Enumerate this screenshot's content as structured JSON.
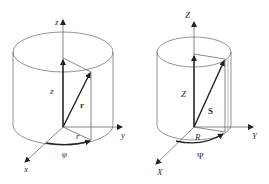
{
  "diagrams": [
    {
      "name": "cylindrical-coordinates-lowercase",
      "labels": {
        "z_axis": "z",
        "z_height": "z",
        "vector": "r",
        "radius": "r",
        "angle": "φ",
        "x_axis": "x",
        "y_axis": "y"
      }
    },
    {
      "name": "cylindrical-coordinates-uppercase",
      "labels": {
        "z_axis": "Z",
        "z_height": "Z",
        "vector": "S",
        "radius": "R",
        "angle": "Ψ",
        "x_axis": "X",
        "y_axis": "Y"
      }
    }
  ],
  "colors": {
    "line": "#555555",
    "vector": "#222222",
    "background": "#ffffff"
  }
}
